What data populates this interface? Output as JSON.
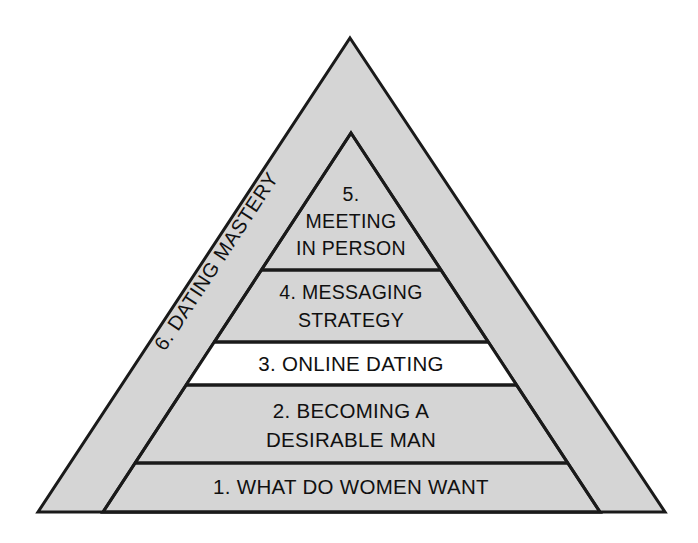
{
  "diagram": {
    "type": "pyramid",
    "background_color": "#ffffff",
    "outline_color": "#1a1a1a",
    "outer_label": {
      "number": "6.",
      "text": "6. DATING MASTERY",
      "fill_color": "#d5d5d5",
      "position": "left-slope-rotated"
    },
    "levels": [
      {
        "number": "5.",
        "lines": [
          "5.",
          "MEETING",
          "IN PERSON"
        ],
        "full_text": "5. MEETING IN PERSON",
        "fill_color": "#d5d5d5"
      },
      {
        "number": "4.",
        "lines": [
          "4. MESSAGING",
          "STRATEGY"
        ],
        "full_text": "4. MESSAGING STRATEGY",
        "fill_color": "#d5d5d5"
      },
      {
        "number": "3.",
        "lines": [
          "3. ONLINE DATING"
        ],
        "full_text": "3. ONLINE DATING",
        "fill_color": "#ffffff"
      },
      {
        "number": "2.",
        "lines": [
          "2. BECOMING A",
          "DESIRABLE MAN"
        ],
        "full_text": "2. BECOMING A DESIRABLE MAN",
        "fill_color": "#d5d5d5"
      },
      {
        "number": "1.",
        "lines": [
          "1. WHAT DO WOMEN WANT"
        ],
        "full_text": "1. WHAT DO WOMEN WANT",
        "fill_color": "#d5d5d5"
      }
    ]
  }
}
